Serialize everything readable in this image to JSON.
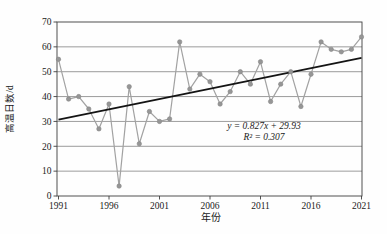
{
  "chart_data": {
    "type": "line",
    "title": "",
    "xlabel": "年份",
    "ylabel": "高温日数/d",
    "x": [
      1991,
      1992,
      1993,
      1994,
      1995,
      1996,
      1997,
      1998,
      1999,
      2000,
      2001,
      2002,
      2003,
      2004,
      2005,
      2006,
      2007,
      2008,
      2009,
      2010,
      2011,
      2012,
      2013,
      2014,
      2015,
      2016,
      2017,
      2018,
      2019,
      2020,
      2021
    ],
    "values": [
      55,
      39,
      40,
      35,
      27,
      37,
      4,
      44,
      21,
      34,
      30,
      31,
      62,
      43,
      49,
      46,
      37,
      42,
      50,
      45,
      54,
      38,
      45,
      50,
      36,
      49,
      62,
      59,
      58,
      59,
      64
    ],
    "ylim": [
      0,
      70
    ],
    "ytick_interval": 10,
    "yticks": [
      0,
      10,
      20,
      30,
      40,
      50,
      60,
      70
    ],
    "xticks": [
      1991,
      1996,
      2001,
      2006,
      2011,
      2016,
      2021
    ],
    "grid": "horizontal",
    "legend": "none",
    "trendline": {
      "slope": 0.827,
      "intercept": 29.93,
      "equation": "y = 0.827x + 29.93",
      "r_squared_label": "R² = 0.307"
    },
    "colors": {
      "series_line": "#a2a2a2",
      "marker_fill": "#969696",
      "marker_stroke": "#868686",
      "trend_line": "#141414",
      "grid_line": "#595959",
      "frame": "#3f3f3f",
      "text": "#1a1a1a",
      "background": "#fefefe"
    }
  }
}
